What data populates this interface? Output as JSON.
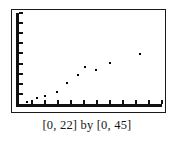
{
  "caption": "[0, 22] by [0, 45]",
  "chart_data": {
    "type": "scatter",
    "title": "",
    "subtitle": "",
    "xlabel": "",
    "ylabel": "",
    "xlim": [
      0,
      22
    ],
    "ylim": [
      0,
      45
    ],
    "grid": false,
    "legend": null,
    "window_label": "[0, 22] by [0, 45]",
    "x_tick_step": 2,
    "y_tick_step": 5,
    "x_ticks": [
      2,
      4,
      6,
      8,
      10,
      12,
      14,
      16,
      18,
      20,
      22
    ],
    "y_ticks": [
      5,
      10,
      15,
      20,
      25,
      30,
      35,
      40,
      45
    ],
    "n_points": 10,
    "x": [
      1.2,
      2.7,
      4.0,
      5.8,
      7.4,
      9.1,
      10.1,
      11.9,
      14.0,
      18.6
    ],
    "y": [
      1.0,
      3.2,
      3.8,
      6.0,
      10.5,
      14.5,
      18.5,
      17.0,
      20.5,
      24.5
    ],
    "points": [
      {
        "x": 1.2,
        "y": 1.0
      },
      {
        "x": 2.7,
        "y": 3.2
      },
      {
        "x": 4.0,
        "y": 3.8
      },
      {
        "x": 5.8,
        "y": 6.0
      },
      {
        "x": 7.4,
        "y": 10.5
      },
      {
        "x": 9.1,
        "y": 14.5
      },
      {
        "x": 10.1,
        "y": 18.5
      },
      {
        "x": 11.9,
        "y": 17.0
      },
      {
        "x": 14.0,
        "y": 20.5
      },
      {
        "x": 18.6,
        "y": 24.5
      }
    ],
    "marker": "dot",
    "marker_color": "#000000",
    "frame_color": "#1a1a1a",
    "background_color": "#ffffff"
  }
}
